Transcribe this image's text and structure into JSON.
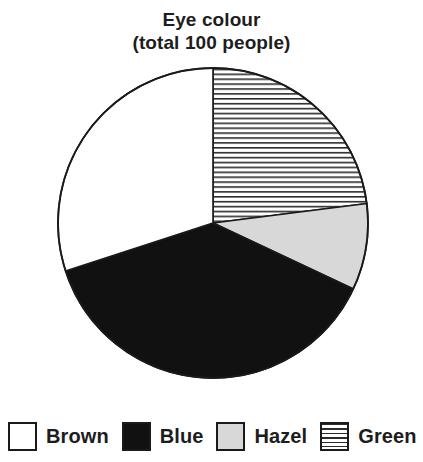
{
  "title": {
    "line1": "Eye colour",
    "line2": "(total 100 people)"
  },
  "legend": {
    "items": [
      {
        "label": "Brown",
        "swatch": "white-square-icon"
      },
      {
        "label": "Blue",
        "swatch": "black-square-icon"
      },
      {
        "label": "Hazel",
        "swatch": "gray-square-icon"
      },
      {
        "label": "Green",
        "swatch": "striped-square-icon"
      }
    ]
  },
  "colors": {
    "outline": "#1a1a1a",
    "brown_fill": "#ffffff",
    "blue_fill": "#111111",
    "hazel_fill": "#d8d8d8",
    "green_fill": "#ffffff",
    "green_hatch": "#2b2b2b",
    "background": "#ffffff",
    "text": "#1d1d1d"
  },
  "geometry": {
    "center_x": 213,
    "center_y": 223,
    "radius": 155
  },
  "chart_data": {
    "type": "pie",
    "title": "Eye colour (total 100 people)",
    "total": 100,
    "unit": "people",
    "start_angle_deg": 0,
    "direction": "clockwise",
    "legend_position": "bottom",
    "categories": [
      "Brown",
      "Blue",
      "Hazel",
      "Green"
    ],
    "values": [
      30,
      38,
      9,
      23
    ],
    "slices": [
      {
        "label": "Green",
        "value": 23,
        "percent": 23,
        "start_angle_deg": 0,
        "end_angle_deg": 82.8,
        "fill": "horizontal-stripes",
        "fill_color": "#ffffff",
        "hatch_color": "#2b2b2b"
      },
      {
        "label": "Hazel",
        "value": 9,
        "percent": 9,
        "start_angle_deg": 82.8,
        "end_angle_deg": 115.2,
        "fill": "solid",
        "fill_color": "#d8d8d8"
      },
      {
        "label": "Blue",
        "value": 38,
        "percent": 38,
        "start_angle_deg": 115.2,
        "end_angle_deg": 252.0,
        "fill": "solid",
        "fill_color": "#111111"
      },
      {
        "label": "Brown",
        "value": 30,
        "percent": 30,
        "start_angle_deg": 252.0,
        "end_angle_deg": 360.0,
        "fill": "solid",
        "fill_color": "#ffffff"
      }
    ],
    "xlabel": "",
    "ylabel": "",
    "grid": false
  }
}
